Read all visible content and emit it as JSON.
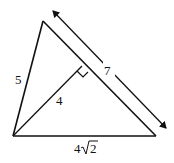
{
  "diagram": {
    "type": "triangle-with-altitude",
    "vertices": {
      "top": {
        "x": 43,
        "y": 21
      },
      "bottom_left": {
        "x": 13,
        "y": 136
      },
      "bottom_right": {
        "x": 156,
        "y": 136
      },
      "altitude_foot": {
        "x": 82,
        "y": 67
      }
    },
    "labels": {
      "left_side": "5",
      "altitude": "4",
      "dimension": "7",
      "base_coef": "4",
      "base_radicand": "2"
    },
    "dimension_arrow": {
      "x1": 53,
      "y1": 11,
      "x2": 166,
      "y2": 128
    },
    "stroke_color": "#111111"
  }
}
